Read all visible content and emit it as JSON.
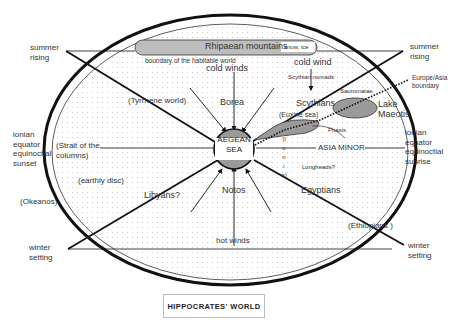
{
  "title": "HIPPOCRATES' WORLD",
  "colors": {
    "ink": "#111111",
    "land_fill": "#ffffff",
    "dot_grid": "#c8c8c8",
    "sea_fill": "#9a9a9a",
    "mountain_fill": "#bdbdbd",
    "label_box": "#ffffff"
  },
  "mountains": {
    "label": "Rhipaean mountains",
    "note": "snow, ice"
  },
  "boundary_label": "boundary of the habitable world",
  "center": {
    "line1": "AEGEAN",
    "line2": "SEA"
  },
  "directions": {
    "summer_rising_left": [
      "summer",
      "rising"
    ],
    "summer_rising_right": [
      "summer",
      "rising"
    ],
    "equator_left": [
      "ionian",
      "equator",
      "equinoctial",
      "sunset"
    ],
    "equator_right": [
      "ionian",
      "equator",
      "equinoctial",
      "sunrise"
    ],
    "winter_setting_left": [
      "winter",
      "setting"
    ],
    "winter_setting_right": [
      "winter",
      "setting"
    ]
  },
  "places": {
    "tyrrhene": "(Tyrrhene world)",
    "strait": [
      "(Strait of the",
      "columns)"
    ],
    "earthly_disc": "(earthly disc)",
    "okeanos": "(Okeanos)",
    "libyans": "Libyans?",
    "egyptians": "Egyptians",
    "ethiopians": "(Ethiopians )",
    "scythians": "Scythians",
    "scythian_nomads": "Scythian nomads",
    "sauromatae": "Sauromatae",
    "lake_maeotis": [
      "Lake",
      "Maeotis"
    ],
    "euxine": "(Euxine sea)",
    "phasis": "Phasis",
    "ionia": [
      "(I",
      "o",
      "n",
      "i",
      "a)"
    ],
    "asia_minor": "ASIA MINOR",
    "longheads": "Longheads?",
    "europe_asia": [
      "Europe/Asia",
      "boundary"
    ]
  },
  "winds": {
    "cold_winds": "cold winds",
    "borea": "Borea",
    "cold_wind": "cold wind",
    "notos": "Notos",
    "hot_winds": "hot winds"
  }
}
